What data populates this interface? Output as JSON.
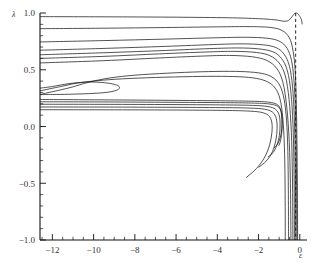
{
  "chart_data": {
    "type": "line",
    "title": "",
    "subtitle": "",
    "xlabel": "ε",
    "ylabel": "λ",
    "xlim": [
      -12.6,
      0.35
    ],
    "ylim": [
      -1.0,
      1.0
    ],
    "grid": false,
    "legend": null,
    "x_ticks": [
      -12,
      -10,
      -8,
      -6,
      -4,
      -2,
      0
    ],
    "x_tick_labels": [
      "−12",
      "−10",
      "−8",
      "−6",
      "−4",
      "−2",
      "0"
    ],
    "x_minor_step": 0.5,
    "y_ticks": [
      -1.0,
      -0.5,
      0.0,
      0.5,
      1.0
    ],
    "y_tick_labels": [
      "−1.0",
      "−0.5",
      "0.0",
      "0.5",
      "1.0"
    ],
    "y_minor_step": 0.1,
    "annotations": [
      {
        "name": "asymptote",
        "type": "dashed-vertical-line",
        "x": -0.2,
        "y_from": 1.0,
        "y_to": -1.0
      }
    ],
    "series": [
      {
        "name": "branch-01",
        "points": [
          [
            -12.6,
            0.968
          ],
          [
            -9,
            0.966
          ],
          [
            -6,
            0.963
          ],
          [
            -3.5,
            0.958
          ],
          [
            -2,
            0.95
          ],
          [
            -1.2,
            0.94
          ],
          [
            -0.6,
            0.93
          ],
          [
            -0.2,
            1.0
          ],
          [
            0.05,
            0.955
          ],
          [
            0.12,
            0.9
          ]
        ]
      },
      {
        "name": "branch-02",
        "points": [
          [
            -12.6,
            0.862
          ],
          [
            -9.5,
            0.866
          ],
          [
            -6.5,
            0.872
          ],
          [
            -4,
            0.878
          ],
          [
            -2.4,
            0.88
          ],
          [
            -1.4,
            0.872
          ],
          [
            -0.85,
            0.845
          ],
          [
            -0.5,
            0.78
          ],
          [
            -0.32,
            0.66
          ],
          [
            -0.22,
            0.48
          ],
          [
            -0.17,
            0.22
          ],
          [
            -0.14,
            -0.1
          ],
          [
            -0.12,
            -0.45
          ],
          [
            -0.11,
            -0.8
          ],
          [
            -0.105,
            -1.0
          ]
        ]
      },
      {
        "name": "branch-03",
        "points": [
          [
            -12.6,
            0.745
          ],
          [
            -9.5,
            0.757
          ],
          [
            -6.5,
            0.77
          ],
          [
            -4,
            0.782
          ],
          [
            -2.6,
            0.786
          ],
          [
            -1.6,
            0.778
          ],
          [
            -1.0,
            0.752
          ],
          [
            -0.62,
            0.69
          ],
          [
            -0.4,
            0.58
          ],
          [
            -0.28,
            0.4
          ],
          [
            -0.21,
            0.14
          ],
          [
            -0.175,
            -0.18
          ],
          [
            -0.155,
            -0.52
          ],
          [
            -0.145,
            -0.85
          ],
          [
            -0.14,
            -1.0
          ]
        ]
      },
      {
        "name": "branch-04",
        "points": [
          [
            -12.6,
            0.672
          ],
          [
            -9.5,
            0.688
          ],
          [
            -6.5,
            0.706
          ],
          [
            -4.2,
            0.722
          ],
          [
            -2.8,
            0.728
          ],
          [
            -1.8,
            0.72
          ],
          [
            -1.15,
            0.695
          ],
          [
            -0.75,
            0.635
          ],
          [
            -0.5,
            0.53
          ],
          [
            -0.35,
            0.35
          ],
          [
            -0.265,
            0.08
          ],
          [
            -0.225,
            -0.25
          ],
          [
            -0.205,
            -0.6
          ],
          [
            -0.197,
            -0.9
          ],
          [
            -0.195,
            -1.0
          ]
        ]
      },
      {
        "name": "branch-05",
        "points": [
          [
            -12.6,
            0.632
          ],
          [
            -9.5,
            0.65
          ],
          [
            -6.5,
            0.67
          ],
          [
            -4.4,
            0.686
          ],
          [
            -3.0,
            0.692
          ],
          [
            -2.0,
            0.684
          ],
          [
            -1.3,
            0.658
          ],
          [
            -0.88,
            0.598
          ],
          [
            -0.6,
            0.49
          ],
          [
            -0.43,
            0.3
          ],
          [
            -0.33,
            0.02
          ],
          [
            -0.285,
            -0.32
          ],
          [
            -0.265,
            -0.68
          ],
          [
            -0.258,
            -1.0
          ]
        ]
      },
      {
        "name": "branch-06",
        "points": [
          [
            -12.6,
            0.6
          ],
          [
            -9.5,
            0.618
          ],
          [
            -6.8,
            0.64
          ],
          [
            -4.6,
            0.656
          ],
          [
            -3.2,
            0.662
          ],
          [
            -2.1,
            0.652
          ],
          [
            -1.45,
            0.624
          ],
          [
            -1.0,
            0.56
          ],
          [
            -0.7,
            0.445
          ],
          [
            -0.52,
            0.24
          ],
          [
            -0.41,
            -0.05
          ],
          [
            -0.36,
            -0.4
          ],
          [
            -0.34,
            -0.75
          ],
          [
            -0.335,
            -1.0
          ]
        ]
      },
      {
        "name": "branch-07",
        "points": [
          [
            -12.6,
            0.56
          ],
          [
            -9.5,
            0.58
          ],
          [
            -6.8,
            0.604
          ],
          [
            -4.8,
            0.62
          ],
          [
            -3.4,
            0.626
          ],
          [
            -2.3,
            0.614
          ],
          [
            -1.6,
            0.582
          ],
          [
            -1.12,
            0.512
          ],
          [
            -0.82,
            0.39
          ],
          [
            -0.63,
            0.17
          ],
          [
            -0.51,
            -0.14
          ],
          [
            -0.455,
            -0.5
          ],
          [
            -0.435,
            -0.85
          ],
          [
            -0.43,
            -1.0
          ]
        ]
      },
      {
        "name": "branch-08-loop-outer",
        "points": [
          [
            -12.6,
            0.282
          ],
          [
            -11.2,
            0.34
          ],
          [
            -10.2,
            0.392
          ],
          [
            -9.2,
            0.428
          ],
          [
            -8.0,
            0.452
          ],
          [
            -6.4,
            0.47
          ],
          [
            -4.8,
            0.482
          ],
          [
            -3.4,
            0.486
          ],
          [
            -2.4,
            0.48
          ],
          [
            -1.7,
            0.462
          ],
          [
            -1.25,
            0.424
          ],
          [
            -0.95,
            0.355
          ],
          [
            -0.76,
            0.24
          ],
          [
            -0.64,
            0.05
          ],
          [
            -0.58,
            -0.22
          ],
          [
            -0.555,
            -0.56
          ],
          [
            -0.548,
            -0.9
          ],
          [
            -0.546,
            -1.0
          ]
        ]
      },
      {
        "name": "branch-09-loop-inner",
        "points": [
          [
            -12.6,
            0.314
          ],
          [
            -11.6,
            0.352
          ],
          [
            -10.8,
            0.382
          ],
          [
            -9.8,
            0.404
          ],
          [
            -8.6,
            0.42
          ],
          [
            -7.0,
            0.432
          ],
          [
            -5.2,
            0.44
          ],
          [
            -3.8,
            0.442
          ],
          [
            -2.7,
            0.436
          ],
          [
            -1.95,
            0.418
          ],
          [
            -1.45,
            0.382
          ],
          [
            -1.12,
            0.318
          ],
          [
            -0.92,
            0.21
          ],
          [
            -0.8,
            0.02
          ],
          [
            -0.735,
            -0.25
          ],
          [
            -0.71,
            -0.6
          ],
          [
            -0.705,
            -1.0
          ]
        ]
      },
      {
        "name": "branch-10-eye",
        "points": [
          [
            -12.6,
            0.338
          ],
          [
            -12.0,
            0.352
          ],
          [
            -11.4,
            0.372
          ],
          [
            -10.8,
            0.386
          ],
          [
            -10.2,
            0.392
          ],
          [
            -9.6,
            0.388
          ],
          [
            -9.1,
            0.376
          ],
          [
            -8.8,
            0.358
          ],
          [
            -8.75,
            0.338
          ],
          [
            -8.9,
            0.318
          ],
          [
            -9.4,
            0.3
          ],
          [
            -10.2,
            0.29
          ],
          [
            -11.2,
            0.284
          ],
          [
            -12.0,
            0.282
          ],
          [
            -12.6,
            0.281
          ]
        ]
      },
      {
        "name": "branch-11-band",
        "points": [
          [
            -12.6,
            0.238
          ],
          [
            -9.0,
            0.234
          ],
          [
            -6.0,
            0.23
          ],
          [
            -3.6,
            0.226
          ],
          [
            -2.2,
            0.222
          ],
          [
            -1.5,
            0.214
          ],
          [
            -1.12,
            0.196
          ],
          [
            -0.95,
            0.16
          ],
          [
            -0.88,
            0.1
          ],
          [
            -0.855,
            0.02
          ],
          [
            -0.875,
            -0.06
          ],
          [
            -0.94,
            -0.13
          ],
          [
            -1.02,
            -0.17
          ]
        ]
      },
      {
        "name": "branch-12-band",
        "points": [
          [
            -12.6,
            0.218
          ],
          [
            -9.0,
            0.216
          ],
          [
            -6.0,
            0.213
          ],
          [
            -3.6,
            0.21
          ],
          [
            -2.2,
            0.206
          ],
          [
            -1.45,
            0.198
          ],
          [
            -1.08,
            0.178
          ],
          [
            -0.92,
            0.14
          ],
          [
            -0.86,
            0.07
          ],
          [
            -0.875,
            -0.02
          ],
          [
            -0.95,
            -0.1
          ],
          [
            -1.08,
            -0.155
          ],
          [
            -1.25,
            -0.19
          ]
        ]
      },
      {
        "name": "branch-13-band",
        "points": [
          [
            -12.6,
            0.196
          ],
          [
            -9.0,
            0.195
          ],
          [
            -6.0,
            0.193
          ],
          [
            -3.6,
            0.19
          ],
          [
            -2.3,
            0.186
          ],
          [
            -1.55,
            0.176
          ],
          [
            -1.18,
            0.152
          ],
          [
            -1.0,
            0.1
          ],
          [
            -0.955,
            0.02
          ],
          [
            -0.99,
            -0.08
          ],
          [
            -1.1,
            -0.16
          ],
          [
            -1.3,
            -0.23
          ],
          [
            -1.55,
            -0.27
          ]
        ]
      },
      {
        "name": "branch-14-band",
        "points": [
          [
            -12.6,
            0.172
          ],
          [
            -9.0,
            0.171
          ],
          [
            -6.0,
            0.169
          ],
          [
            -3.6,
            0.166
          ],
          [
            -2.4,
            0.162
          ],
          [
            -1.7,
            0.152
          ],
          [
            -1.32,
            0.126
          ],
          [
            -1.14,
            0.07
          ],
          [
            -1.1,
            -0.02
          ],
          [
            -1.16,
            -0.12
          ],
          [
            -1.32,
            -0.22
          ],
          [
            -1.6,
            -0.3
          ],
          [
            -2.0,
            -0.36
          ]
        ]
      },
      {
        "name": "branch-15-band",
        "points": [
          [
            -12.6,
            0.148
          ],
          [
            -9.0,
            0.147
          ],
          [
            -6.0,
            0.145
          ],
          [
            -3.8,
            0.142
          ],
          [
            -2.6,
            0.137
          ],
          [
            -1.9,
            0.126
          ],
          [
            -1.52,
            0.098
          ],
          [
            -1.36,
            0.04
          ],
          [
            -1.35,
            -0.05
          ],
          [
            -1.46,
            -0.16
          ],
          [
            -1.7,
            -0.27
          ],
          [
            -2.1,
            -0.37
          ],
          [
            -2.6,
            -0.45
          ]
        ]
      }
    ]
  },
  "axis_labels": {
    "y": "λ",
    "x": "ε"
  }
}
